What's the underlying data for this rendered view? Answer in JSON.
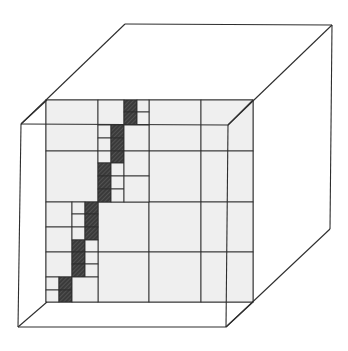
{
  "figure": {
    "description": "Isometric cube containing an adaptive quadtree grid panel; a staircase of hatched fine cells runs diagonally from top-center to bottom-left",
    "colors": {
      "line": "#2e2e2e",
      "panel_fill": "#efefef",
      "hatch_fill": "#3a3a3a",
      "background": "#ffffff"
    },
    "cube": {
      "front_face": [
        [
          21,
          124
        ],
        [
          228,
          125
        ],
        [
          226,
          327
        ],
        [
          18,
          327
        ]
      ],
      "back_face": [
        [
          125,
          24
        ],
        [
          332,
          25
        ],
        [
          330,
          229
        ],
        [
          47,
          302
        ]
      ],
      "visible_edges": [
        [
          [
            21,
            124
          ],
          [
            125,
            24
          ]
        ],
        [
          [
            125,
            24
          ],
          [
            332,
            25
          ]
        ],
        [
          [
            332,
            25
          ],
          [
            330,
            229
          ]
        ],
        [
          [
            330,
            229
          ],
          [
            226,
            327
          ]
        ],
        [
          [
            228,
            125
          ],
          [
            332,
            25
          ]
        ],
        [
          [
            21,
            124
          ],
          [
            228,
            125
          ]
        ],
        [
          [
            21,
            124
          ],
          [
            18,
            327
          ]
        ],
        [
          [
            18,
            327
          ],
          [
            226,
            327
          ]
        ],
        [
          [
            228,
            125
          ],
          [
            226,
            327
          ]
        ],
        [
          [
            18,
            327
          ],
          [
            47,
            302
          ]
        ],
        [
          [
            226,
            327
          ],
          [
            253,
            302
          ]
        ],
        [
          [
            47,
            100
          ],
          [
            21,
            124
          ]
        ],
        [
          [
            253,
            100
          ],
          [
            228,
            125
          ]
        ]
      ]
    },
    "panel": {
      "x": 46,
      "y": 100,
      "width": 207,
      "height": 202,
      "level0_cols": [
        46,
        98,
        149,
        201,
        253
      ],
      "level0_rows": [
        100,
        151,
        202,
        252,
        302
      ]
    },
    "cells": [
      {
        "x": 46,
        "y": 100,
        "w": 52,
        "h": 51,
        "type": "empty"
      },
      {
        "x": 46,
        "y": 151,
        "w": 52,
        "h": 51,
        "type": "empty"
      },
      {
        "x": 149,
        "y": 100,
        "w": 52,
        "h": 51,
        "type": "empty"
      },
      {
        "x": 201,
        "y": 100,
        "w": 52,
        "h": 51,
        "type": "empty"
      },
      {
        "x": 149,
        "y": 151,
        "w": 52,
        "h": 51,
        "type": "empty"
      },
      {
        "x": 201,
        "y": 151,
        "w": 52,
        "h": 51,
        "type": "empty"
      },
      {
        "x": 98,
        "y": 202,
        "w": 51,
        "h": 50,
        "type": "empty"
      },
      {
        "x": 149,
        "y": 202,
        "w": 52,
        "h": 50,
        "type": "empty"
      },
      {
        "x": 201,
        "y": 202,
        "w": 52,
        "h": 50,
        "type": "empty"
      },
      {
        "x": 98,
        "y": 252,
        "w": 51,
        "h": 50,
        "type": "empty"
      },
      {
        "x": 149,
        "y": 252,
        "w": 52,
        "h": 50,
        "type": "empty"
      },
      {
        "x": 201,
        "y": 252,
        "w": 52,
        "h": 50,
        "type": "empty"
      },
      {
        "x": 98,
        "y": 100,
        "w": 26,
        "h": 25,
        "type": "empty"
      },
      {
        "x": 124,
        "y": 100,
        "w": 13,
        "h": 12,
        "type": "hatched"
      },
      {
        "x": 124,
        "y": 112,
        "w": 13,
        "h": 13,
        "type": "hatched"
      },
      {
        "x": 137,
        "y": 100,
        "w": 12,
        "h": 12,
        "type": "empty"
      },
      {
        "x": 137,
        "y": 112,
        "w": 12,
        "h": 13,
        "type": "empty"
      },
      {
        "x": 98,
        "y": 125,
        "w": 13,
        "h": 13,
        "type": "empty"
      },
      {
        "x": 98,
        "y": 138,
        "w": 13,
        "h": 13,
        "type": "empty"
      },
      {
        "x": 111,
        "y": 125,
        "w": 13,
        "h": 13,
        "type": "hatched"
      },
      {
        "x": 111,
        "y": 138,
        "w": 13,
        "h": 13,
        "type": "hatched"
      },
      {
        "x": 124,
        "y": 125,
        "w": 25,
        "h": 26,
        "type": "empty"
      },
      {
        "x": 98,
        "y": 151,
        "w": 13,
        "h": 12,
        "type": "empty"
      },
      {
        "x": 111,
        "y": 151,
        "w": 13,
        "h": 12,
        "type": "hatched"
      },
      {
        "x": 98,
        "y": 163,
        "w": 13,
        "h": 13,
        "type": "hatched"
      },
      {
        "x": 111,
        "y": 163,
        "w": 13,
        "h": 13,
        "type": "empty"
      },
      {
        "x": 124,
        "y": 151,
        "w": 25,
        "h": 25,
        "type": "empty"
      },
      {
        "x": 98,
        "y": 176,
        "w": 13,
        "h": 13,
        "type": "hatched"
      },
      {
        "x": 98,
        "y": 189,
        "w": 13,
        "h": 13,
        "type": "hatched"
      },
      {
        "x": 111,
        "y": 176,
        "w": 13,
        "h": 13,
        "type": "empty"
      },
      {
        "x": 111,
        "y": 189,
        "w": 13,
        "h": 13,
        "type": "empty"
      },
      {
        "x": 124,
        "y": 176,
        "w": 25,
        "h": 26,
        "type": "empty"
      },
      {
        "x": 46,
        "y": 202,
        "w": 26,
        "h": 25,
        "type": "empty"
      },
      {
        "x": 72,
        "y": 202,
        "w": 13,
        "h": 12,
        "type": "empty"
      },
      {
        "x": 72,
        "y": 214,
        "w": 13,
        "h": 13,
        "type": "empty"
      },
      {
        "x": 85,
        "y": 202,
        "w": 13,
        "h": 12,
        "type": "hatched"
      },
      {
        "x": 85,
        "y": 214,
        "w": 13,
        "h": 13,
        "type": "hatched"
      },
      {
        "x": 46,
        "y": 227,
        "w": 26,
        "h": 25,
        "type": "empty"
      },
      {
        "x": 72,
        "y": 227,
        "w": 13,
        "h": 13,
        "type": "empty"
      },
      {
        "x": 85,
        "y": 227,
        "w": 13,
        "h": 13,
        "type": "hatched"
      },
      {
        "x": 72,
        "y": 240,
        "w": 13,
        "h": 12,
        "type": "hatched"
      },
      {
        "x": 85,
        "y": 240,
        "w": 13,
        "h": 12,
        "type": "empty"
      },
      {
        "x": 46,
        "y": 252,
        "w": 26,
        "h": 25,
        "type": "empty"
      },
      {
        "x": 72,
        "y": 252,
        "w": 13,
        "h": 12,
        "type": "hatched"
      },
      {
        "x": 72,
        "y": 264,
        "w": 13,
        "h": 13,
        "type": "hatched"
      },
      {
        "x": 85,
        "y": 252,
        "w": 13,
        "h": 12,
        "type": "empty"
      },
      {
        "x": 85,
        "y": 264,
        "w": 13,
        "h": 13,
        "type": "empty"
      },
      {
        "x": 46,
        "y": 277,
        "w": 13,
        "h": 13,
        "type": "empty"
      },
      {
        "x": 46,
        "y": 290,
        "w": 13,
        "h": 12,
        "type": "empty"
      },
      {
        "x": 59,
        "y": 277,
        "w": 13,
        "h": 13,
        "type": "hatched"
      },
      {
        "x": 59,
        "y": 290,
        "w": 13,
        "h": 12,
        "type": "hatched"
      },
      {
        "x": 72,
        "y": 277,
        "w": 26,
        "h": 25,
        "type": "empty"
      }
    ]
  }
}
